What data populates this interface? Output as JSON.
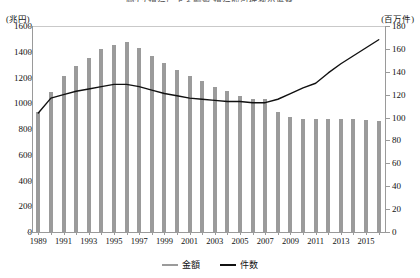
{
  "title": "図3-2 銀行による融資 銀行取引件数の推移",
  "axes": {
    "left_unit": "(兆円)",
    "right_unit": "(百万件)",
    "left_ticks": [
      0,
      200,
      400,
      600,
      800,
      1000,
      1200,
      1400,
      1600
    ],
    "right_ticks": [
      0,
      20,
      40,
      60,
      80,
      100,
      120,
      140,
      160,
      180
    ]
  },
  "legend": {
    "items": [
      {
        "label": "金額",
        "color": "#9b9b9b"
      },
      {
        "label": "件数",
        "color": "#111111"
      }
    ]
  },
  "colors": {
    "bar": "#9b9b9b",
    "line": "#111111",
    "axis": "#9a9a9a"
  },
  "chart_data": {
    "type": "bar",
    "title": "図3-2 銀行による融資 銀行取引件数の推移",
    "xlabel": "",
    "ylabel": "(兆円)",
    "y2label": "(百万件)",
    "ylim": [
      0,
      1600
    ],
    "y2lim": [
      0,
      180
    ],
    "grid": false,
    "legend_position": "bottom",
    "x": [
      1989,
      1990,
      1991,
      1992,
      1993,
      1994,
      1995,
      1996,
      1997,
      1998,
      1999,
      2000,
      2001,
      2002,
      2003,
      2004,
      2005,
      2006,
      2007,
      2008,
      2009,
      2010,
      2011,
      2012,
      2013,
      2014,
      2015,
      2016
    ],
    "tick_labels": [
      "1989",
      "1991",
      "1993",
      "1995",
      "1997",
      "1999",
      "2001",
      "2003",
      "2005",
      "2007",
      "2009",
      "2011",
      "2013",
      "2015"
    ],
    "series": [
      {
        "name": "金額",
        "type": "bar",
        "axis": "left",
        "unit": "兆円",
        "color": "#9b9b9b",
        "values": [
          930,
          1090,
          1215,
          1290,
          1355,
          1420,
          1450,
          1475,
          1430,
          1370,
          1310,
          1255,
          1215,
          1175,
          1130,
          1095,
          1060,
          1030,
          1030,
          935,
          895,
          880,
          875,
          875,
          875,
          875,
          870,
          860
        ]
      },
      {
        "name": "件数",
        "type": "line",
        "axis": "right",
        "unit": "百万件",
        "color": "#111111",
        "values": [
          104,
          117,
          120,
          123,
          125,
          127,
          129,
          129,
          127,
          124,
          121,
          119,
          117,
          116,
          115,
          114,
          114,
          113,
          113,
          116,
          121,
          126,
          130,
          139,
          147,
          154,
          161,
          168
        ]
      }
    ]
  }
}
